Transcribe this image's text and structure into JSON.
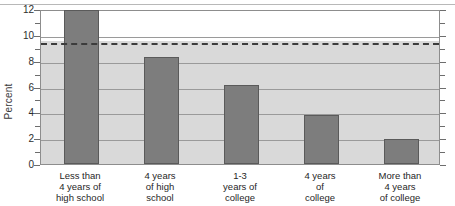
{
  "chart_data": {
    "type": "bar",
    "title": "",
    "xlabel": "",
    "ylabel": "Percent",
    "ylim": [
      0,
      12
    ],
    "ytick_labels": [
      "0",
      "2",
      "4",
      "6",
      "8",
      "10",
      "12"
    ],
    "ytick_values": [
      0,
      2,
      4,
      6,
      8,
      10,
      12
    ],
    "minor_ticks": [
      1,
      3,
      5,
      7,
      9,
      11
    ],
    "grid": true,
    "legend": "none",
    "categories": [
      "Less than 4 years of high school",
      "4 years of high school",
      "1-3 years of college",
      "4 years of college",
      "More than 4 years of college"
    ],
    "category_lines": [
      [
        "Less than",
        "4 years of",
        "high school"
      ],
      [
        "4 years",
        "of high",
        "school"
      ],
      [
        "1-3",
        "years of",
        "college"
      ],
      [
        "4 years",
        "of",
        "college"
      ],
      [
        "More than",
        "4 years",
        "of college"
      ]
    ],
    "values": [
      11.9,
      8.3,
      6.1,
      3.8,
      1.9
    ],
    "reference_line": {
      "value": 9.5,
      "style": "dashed",
      "label": ""
    },
    "colors": {
      "bar_fill": "#7d7d7d",
      "bar_edge": "#5a5a5a",
      "plot_background_upper": "#ffffff",
      "plot_background_lower": "#d9d9d9",
      "gridline": "#9a9a9a",
      "reference_line": "#3c3c3c",
      "axis": "#8d8d8d",
      "text": "#1f1f1f"
    }
  }
}
